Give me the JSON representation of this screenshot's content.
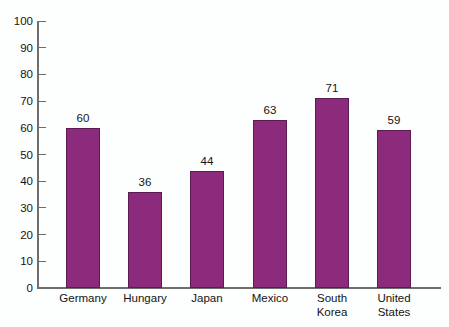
{
  "chart_data": {
    "type": "bar",
    "title": "",
    "subtitle": "",
    "xlabel": "",
    "ylabel": "",
    "categories": [
      "Germany",
      "Hungary",
      "Japan",
      "Mexico",
      "South Korea",
      "United States"
    ],
    "category_lines": [
      [
        "Germany"
      ],
      [
        "Hungary"
      ],
      [
        "Japan"
      ],
      [
        "Mexico"
      ],
      [
        "South",
        "Korea"
      ],
      [
        "United",
        "States"
      ]
    ],
    "values": [
      60,
      36,
      44,
      63,
      71,
      59
    ],
    "value_labels": [
      "60",
      "36",
      "44",
      "63",
      "71",
      "59"
    ],
    "ylim": [
      0,
      100
    ],
    "ytick_values": [
      0,
      10,
      20,
      30,
      40,
      50,
      60,
      70,
      80,
      90,
      100
    ],
    "ytick_labels": [
      "0",
      "10",
      "20",
      "30",
      "40",
      "50",
      "60",
      "70",
      "80",
      "90",
      "100"
    ],
    "grid": false,
    "legend": false,
    "legend_position": "none",
    "bar_color": "#8c2a7c",
    "bar_edge_color": "#5d1b53",
    "axis_color": "#6e6e6e",
    "text_color": "#141414",
    "background_color": "#fdfefe"
  }
}
